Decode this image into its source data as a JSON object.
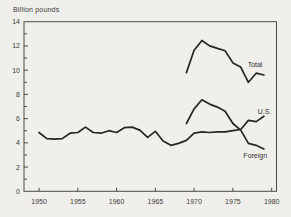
{
  "colors": {
    "background": "#f1efeb",
    "frame": "#4a4a46",
    "line": "#262626",
    "text": "#3a3a3a"
  },
  "chart_data": {
    "type": "line",
    "title": "",
    "ylabel": "Billion pounds",
    "xlabel": "",
    "grid": false,
    "legend_position": "inline-labels",
    "xlim": [
      1948.1,
      1980.7
    ],
    "ylim": [
      0,
      14
    ],
    "y_axis": {
      "tick_values": [
        14,
        12,
        10,
        8,
        6,
        4,
        2,
        0
      ],
      "tick_labels": [
        "14",
        "12",
        "10",
        "8",
        "6",
        "4",
        "2",
        "0"
      ],
      "minor_tick_values": [
        1,
        3,
        5,
        7,
        9,
        11,
        13
      ]
    },
    "x_axis": {
      "tick_values": [
        1950,
        1955,
        1960,
        1965,
        1970,
        1975,
        1980
      ],
      "tick_labels": [
        "1950",
        "1955",
        "1960",
        "1965",
        "1970",
        "1975",
        "1980"
      ]
    },
    "series": [
      {
        "name": "Total",
        "label": "Total",
        "label_anchor": {
          "x": 1976.9,
          "y": 10.45
        },
        "x": [
          1969,
          1970,
          1971,
          1972,
          1973,
          1974,
          1975,
          1976,
          1977,
          1978,
          1979
        ],
        "values": [
          9.8,
          11.65,
          12.45,
          12.0,
          11.8,
          11.6,
          10.6,
          10.25,
          9.0,
          9.75,
          9.6
        ]
      },
      {
        "name": "U.S.",
        "label": "U.S.",
        "label_anchor": {
          "x": 1978.2,
          "y": 6.6
        },
        "x": [
          1950,
          1951,
          1952,
          1953,
          1954,
          1955,
          1956,
          1957,
          1958,
          1959,
          1960,
          1961,
          1962,
          1963,
          1964,
          1965,
          1966,
          1967,
          1968,
          1969,
          1970,
          1971,
          1972,
          1973,
          1974,
          1975,
          1976,
          1977,
          1978,
          1979
        ],
        "values": [
          4.85,
          4.35,
          4.3,
          4.35,
          4.8,
          4.85,
          5.3,
          4.85,
          4.8,
          5.0,
          4.85,
          5.25,
          5.3,
          5.05,
          4.45,
          4.95,
          4.15,
          3.8,
          3.95,
          4.2,
          4.8,
          4.9,
          4.85,
          4.9,
          4.9,
          5.0,
          5.1,
          5.85,
          5.75,
          6.2
        ]
      },
      {
        "name": "Foreign",
        "label": "Foreign",
        "label_anchor": {
          "x": 1976.35,
          "y": 2.95
        },
        "x": [
          1969,
          1970,
          1971,
          1972,
          1973,
          1974,
          1975,
          1976,
          1977,
          1978,
          1979
        ],
        "values": [
          5.6,
          6.8,
          7.55,
          7.2,
          6.95,
          6.6,
          5.6,
          5.05,
          3.95,
          3.8,
          3.5
        ]
      }
    ]
  }
}
